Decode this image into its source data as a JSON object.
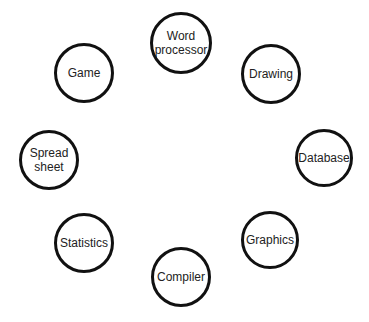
{
  "diagram": {
    "type": "circular-node-arrangement",
    "nodes": [
      {
        "id": "word-processor",
        "label": "Word\nprocessor",
        "cx": 181,
        "cy": 43,
        "r": 31
      },
      {
        "id": "drawing",
        "label": "Drawing",
        "cx": 271,
        "cy": 74,
        "r": 30
      },
      {
        "id": "database",
        "label": "Database",
        "cx": 324,
        "cy": 158,
        "r": 29
      },
      {
        "id": "graphics",
        "label": "Graphics",
        "cx": 270,
        "cy": 240,
        "r": 29
      },
      {
        "id": "compiler",
        "label": "Compiler",
        "cx": 181,
        "cy": 277,
        "r": 30
      },
      {
        "id": "statistics",
        "label": "Statistics",
        "cx": 84,
        "cy": 243,
        "r": 30
      },
      {
        "id": "spreadsheet",
        "label": "Spread\nsheet",
        "cx": 49,
        "cy": 160,
        "r": 30
      },
      {
        "id": "game",
        "label": "Game",
        "cx": 84,
        "cy": 73,
        "r": 30
      }
    ],
    "stroke_color": "#111111",
    "text_color": "#222222",
    "background": "#ffffff"
  }
}
